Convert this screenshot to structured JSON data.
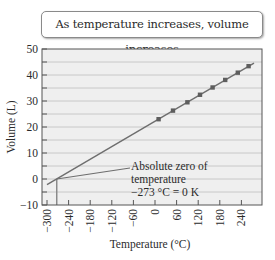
{
  "callout": {
    "text": "As temperature increases, volume increases"
  },
  "annotation": {
    "line1": "Absolute zero of",
    "line2": "temperature",
    "line3": "−273 °C = 0 K"
  },
  "colors": {
    "plot_bg": "#efefef",
    "grid": "#c8c8c8",
    "line": "#6e6e6e",
    "marker": "#5e5e5e",
    "frame": "#555555"
  },
  "chart_data": {
    "type": "line",
    "title": "As temperature increases, volume increases",
    "xlabel": "Temperature (°C)",
    "ylabel": "Volume (L)",
    "xlim": [
      -300,
      280
    ],
    "ylim": [
      -10,
      50
    ],
    "x_ticks": [
      -300,
      -240,
      -180,
      -120,
      -60,
      0,
      60,
      120,
      180,
      240
    ],
    "x_tick_labels": [
      "−300",
      "−240",
      "−180",
      "−120",
      "−60",
      "0",
      "60",
      "120",
      "180",
      "240"
    ],
    "y_ticks": [
      -10,
      0,
      10,
      20,
      30,
      40,
      50
    ],
    "y_tick_labels": [
      "−10",
      "0",
      "10",
      "20",
      "30",
      "40",
      "50"
    ],
    "grid": true,
    "grid_step_y": 5,
    "series": [
      {
        "name": "Measured volume",
        "x": [
          10,
          50,
          90,
          125,
          160,
          195,
          230,
          260
        ],
        "values": [
          23.0,
          26.3,
          29.5,
          32.4,
          35.2,
          38.1,
          40.9,
          43.4
        ],
        "marker": "square"
      },
      {
        "name": "Linear extrapolation",
        "x": [
          -300,
          275
        ],
        "values": [
          -2.2,
          44.6
        ],
        "marker": "none"
      }
    ],
    "annotations": [
      {
        "text": "Absolute zero of temperature −273 °C = 0 K",
        "x": -273,
        "y": 0
      }
    ]
  }
}
